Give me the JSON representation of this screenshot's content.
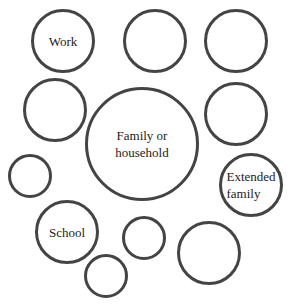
{
  "diagram": {
    "type": "ecomap-circles",
    "stroke_color": "#444444",
    "background": "#ffffff",
    "circles": [
      {
        "id": "work",
        "lines": [
          "Work"
        ],
        "cx": 63,
        "cy": 41,
        "r": 32
      },
      {
        "id": "top-middle",
        "lines": [],
        "cx": 155,
        "cy": 41,
        "r": 32
      },
      {
        "id": "top-right",
        "lines": [],
        "cx": 236,
        "cy": 41,
        "r": 32
      },
      {
        "id": "left-middle",
        "lines": [],
        "cx": 55,
        "cy": 110,
        "r": 32
      },
      {
        "id": "family",
        "lines": [
          "Family or",
          "household"
        ],
        "cx": 142,
        "cy": 144,
        "r": 57
      },
      {
        "id": "right-middle",
        "lines": [],
        "cx": 236,
        "cy": 114,
        "r": 32
      },
      {
        "id": "small-left",
        "lines": [],
        "cx": 30,
        "cy": 176,
        "r": 22
      },
      {
        "id": "extended-family",
        "lines": [
          "Extended",
          "family"
        ],
        "cx": 251,
        "cy": 185,
        "r": 32
      },
      {
        "id": "school",
        "lines": [
          "School"
        ],
        "cx": 67,
        "cy": 232,
        "r": 32
      },
      {
        "id": "small-center",
        "lines": [],
        "cx": 144,
        "cy": 238,
        "r": 22
      },
      {
        "id": "bottom-right",
        "lines": [],
        "cx": 209,
        "cy": 253,
        "r": 32
      },
      {
        "id": "bottom-small",
        "lines": [],
        "cx": 106,
        "cy": 276,
        "r": 22
      }
    ]
  },
  "labels": {
    "work": "Work",
    "family_line1": "Family or",
    "family_line2": "household",
    "extended_line1": "Extended",
    "extended_line2": "family",
    "school": "School"
  }
}
